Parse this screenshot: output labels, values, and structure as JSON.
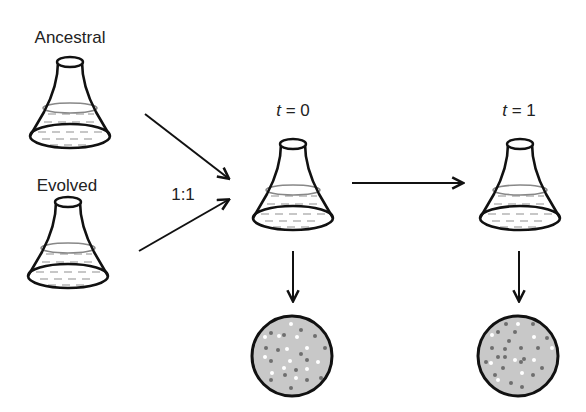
{
  "diagram": {
    "type": "competition-assay-schematic",
    "sources": [
      {
        "label": "Ancestral"
      },
      {
        "label": "Evolved"
      }
    ],
    "mix_ratio": "1:1",
    "timepoints": [
      {
        "var": "t",
        "eq": " = 0",
        "value": "0"
      },
      {
        "var": "t",
        "eq": " = 1",
        "value": "1"
      }
    ],
    "plates": [
      {
        "timepoint": "t = 0",
        "white_colonies": 13,
        "grey_colonies": 14
      },
      {
        "timepoint": "t = 1",
        "white_colonies": 9,
        "grey_colonies": 21
      }
    ],
    "colors": {
      "stroke": "#111111",
      "plate_fill": "#c8c8c8",
      "grey_colony": "#6e6e6e",
      "white_colony": "#ffffff",
      "liquid_line": "#888888"
    }
  }
}
